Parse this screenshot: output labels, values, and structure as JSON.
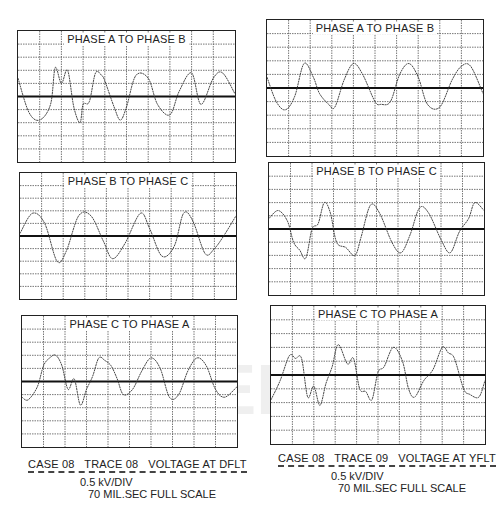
{
  "figure": {
    "left": {
      "caption": {
        "line1": "CASE 08   TRACE 08   VOLTAGE AT DFLT",
        "line2": "0.5 kV/DIV",
        "line3": "70 MIL.SEC FULL SCALE"
      },
      "panels": [
        {
          "title": "PHASE A TO PHASE B"
        },
        {
          "title": "PHASE B TO PHASE C"
        },
        {
          "title": "PHASE C TO PHASE A"
        }
      ]
    },
    "right": {
      "caption": {
        "line1": "CASE 08   TRACE 09   VOLTAGE AT YFLT",
        "line2": "0.5 kV/DIV",
        "line3": "70 MIL.SEC FULL SCALE"
      },
      "panels": [
        {
          "title": "PHASE A TO PHASE B"
        },
        {
          "title": "PHASE B TO PHASE C"
        },
        {
          "title": "PHASE C TO PHASE A"
        }
      ]
    },
    "watermark": "IEEE"
  },
  "chart_data": [
    {
      "type": "line",
      "title": "PHASE A TO PHASE B",
      "group": "CASE 08 TRACE 08 VOLTAGE AT DFLT",
      "xlabel": "time (70 ms full scale, 10 div)",
      "ylabel": "voltage (0.5 kV/DIV)",
      "xlim": [
        0,
        70
      ],
      "ylim": [
        -2.5,
        2.5
      ],
      "grid": true,
      "x": [
        0,
        3.5,
        7,
        10.5,
        12,
        14,
        16,
        18,
        20,
        21,
        23,
        25,
        27,
        28,
        31,
        33,
        35,
        38,
        42,
        45,
        49,
        52,
        56,
        59,
        63,
        66,
        70
      ],
      "values": [
        0.7,
        -0.6,
        -0.9,
        -0.3,
        1.1,
        0.5,
        1.0,
        -0.4,
        -1.0,
        -0.3,
        -0.2,
        0.9,
        0.8,
        0.6,
        -0.4,
        -0.9,
        -0.4,
        0.8,
        0.7,
        -0.3,
        -0.7,
        0.2,
        0.9,
        -0.3,
        0.7,
        0.9,
        0.1
      ]
    },
    {
      "type": "line",
      "title": "PHASE B TO PHASE C",
      "group": "CASE 08 TRACE 08 VOLTAGE AT DFLT",
      "xlabel": "time (70 ms full scale, 10 div)",
      "ylabel": "voltage (0.5 kV/DIV)",
      "xlim": [
        0,
        70
      ],
      "ylim": [
        -2.5,
        2.5
      ],
      "grid": true,
      "x": [
        0,
        4,
        8,
        12,
        15,
        19,
        23,
        27,
        30,
        34,
        39,
        42,
        46,
        50,
        53,
        56,
        60,
        63,
        66,
        70
      ],
      "values": [
        0.1,
        0.9,
        0.5,
        -1.0,
        -0.6,
        0.8,
        0.8,
        -0.2,
        -0.9,
        -0.3,
        0.9,
        0.3,
        -0.8,
        -0.4,
        0.9,
        0.6,
        -0.7,
        -0.5,
        0.0,
        0.8
      ]
    },
    {
      "type": "line",
      "title": "PHASE C TO PHASE A",
      "group": "CASE 08 TRACE 08 VOLTAGE AT DFLT",
      "xlabel": "time (70 ms full scale, 10 div)",
      "ylabel": "voltage (0.5 kV/DIV)",
      "xlim": [
        0,
        70
      ],
      "ylim": [
        -2.5,
        2.5
      ],
      "grid": true,
      "x": [
        0,
        2,
        5,
        7,
        9,
        11,
        13,
        15,
        17,
        19,
        21,
        23,
        25,
        27,
        29,
        31,
        33,
        36,
        39,
        42,
        45,
        48,
        51,
        54,
        57,
        60,
        63,
        66,
        70
      ],
      "values": [
        -0.6,
        -0.7,
        -0.2,
        0.6,
        0.9,
        1.0,
        0.6,
        -0.3,
        0.1,
        -0.9,
        -0.3,
        0.2,
        0.9,
        0.8,
        0.6,
        0.1,
        -0.5,
        -0.3,
        0.4,
        0.9,
        0.5,
        -0.6,
        -0.5,
        0.4,
        0.9,
        0.6,
        -0.3,
        -0.6,
        -0.2
      ]
    },
    {
      "type": "line",
      "title": "PHASE A TO PHASE B",
      "group": "CASE 08 TRACE 09 VOLTAGE AT YFLT",
      "xlabel": "time (70 ms full scale, 10 div)",
      "ylabel": "voltage (0.5 kV/DIV)",
      "xlim": [
        0,
        70
      ],
      "ylim": [
        -2.5,
        2.5
      ],
      "grid": true,
      "x": [
        0,
        3,
        6,
        9,
        12,
        15,
        17,
        20,
        22,
        25,
        28,
        31,
        35,
        37,
        40,
        43,
        46,
        49,
        52,
        56,
        60,
        63,
        66,
        70
      ],
      "values": [
        0.4,
        -0.5,
        -0.8,
        -0.3,
        0.9,
        0.4,
        -0.2,
        -0.6,
        -0.7,
        0.3,
        0.9,
        0.5,
        -0.5,
        -0.6,
        -0.5,
        0.5,
        0.9,
        0.4,
        -0.6,
        -0.7,
        0.3,
        0.8,
        0.8,
        -0.2
      ]
    },
    {
      "type": "line",
      "title": "PHASE B TO PHASE C",
      "group": "CASE 08 TRACE 09 VOLTAGE AT YFLT",
      "xlabel": "time (70 ms full scale, 10 div)",
      "ylabel": "voltage (0.5 kV/DIV)",
      "xlim": [
        0,
        70
      ],
      "ylim": [
        -2.5,
        2.5
      ],
      "grid": true,
      "x": [
        0,
        3,
        6,
        8,
        10,
        12,
        14,
        16,
        18,
        20,
        22,
        25,
        28,
        30,
        33,
        36,
        40,
        43,
        46,
        49,
        52,
        56,
        59,
        62,
        65,
        67,
        70
      ],
      "values": [
        0.4,
        0.7,
        0.3,
        -0.5,
        -0.8,
        -1.1,
        0.0,
        0.2,
        1.0,
        0.6,
        -0.5,
        -0.7,
        -1.0,
        -0.3,
        0.9,
        0.6,
        -0.5,
        -0.9,
        -0.2,
        0.8,
        0.6,
        -0.4,
        -0.9,
        -0.1,
        0.4,
        1.0,
        0.7
      ]
    },
    {
      "type": "line",
      "title": "PHASE C TO PHASE A",
      "group": "CASE 08 TRACE 09 VOLTAGE AT YFLT",
      "xlabel": "time (70 ms full scale, 10 div)",
      "ylabel": "voltage (0.5 kV/DIV)",
      "xlim": [
        0,
        70
      ],
      "ylim": [
        -2.5,
        2.5
      ],
      "grid": true,
      "x": [
        0,
        3,
        6,
        8,
        10,
        12,
        14,
        16,
        18,
        20,
        22,
        25,
        27,
        29,
        31,
        33,
        35,
        37,
        40,
        43,
        45,
        47,
        50,
        53,
        56,
        58,
        60,
        63,
        65,
        68,
        70
      ],
      "values": [
        -0.9,
        -0.2,
        0.7,
        0.6,
        0.6,
        -0.8,
        -0.4,
        -1.1,
        -0.3,
        0.3,
        1.1,
        0.4,
        0.6,
        -0.5,
        -0.6,
        -0.9,
        0.1,
        0.3,
        1.0,
        0.5,
        -0.5,
        -0.8,
        -0.2,
        0.2,
        1.0,
        0.8,
        0.6,
        -0.5,
        -0.7,
        -0.8,
        -0.2
      ]
    }
  ]
}
